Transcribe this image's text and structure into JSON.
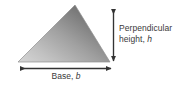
{
  "figure": {
    "name": "triangle-area-diagram",
    "shape": "triangle",
    "background_color": "#ffffff"
  },
  "shape": {
    "fill_light": "#cfcfcf",
    "fill_dark": "#636363",
    "outline_color": "#8a8a8a",
    "apex": {
      "x": 75,
      "y": 5
    },
    "base_left": {
      "x": 18,
      "y": 62
    },
    "base_right": {
      "x": 110,
      "y": 62
    }
  },
  "annotations": {
    "height": {
      "line1": "Perpendicular",
      "line2_prefix": "height, ",
      "line2_variable": "h",
      "arrow": "double-headed-vertical-arrow",
      "color": "#3a3a3a"
    },
    "base": {
      "prefix": "Base, ",
      "variable": "b",
      "arrow": "double-headed-horizontal-arrow",
      "color": "#3a3a3a"
    }
  }
}
